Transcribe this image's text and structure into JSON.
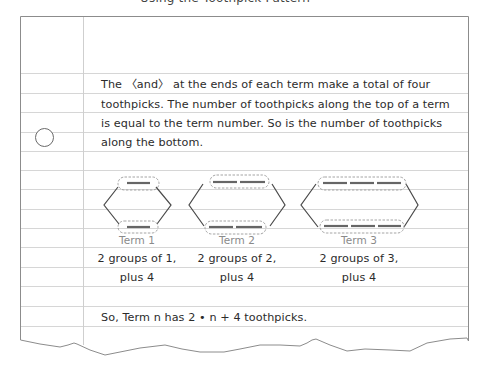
{
  "page": {
    "cutoff_heading": "Using the Toothpick Pattern",
    "paragraph_lines": [
      "The 〈and〉 at the ends of each term make a total of four",
      "toothpicks. The number of toothpicks along the top of a term",
      "is equal to the term number. So is the number of toothpicks",
      "along the bottom."
    ],
    "terms": [
      {
        "label": "Term 1",
        "caption_line1": "2 groups of 1,",
        "caption_line2": "plus 4",
        "toothpicks_per_side": 1
      },
      {
        "label": "Term 2",
        "caption_line1": "2 groups of 2,",
        "caption_line2": "plus 4",
        "toothpicks_per_side": 2
      },
      {
        "label": "Term 3",
        "caption_line1": "2 groups of 3,",
        "caption_line2": "plus 4",
        "toothpicks_per_side": 3
      }
    ],
    "conclusion": "So, Term n has 2 • n + 4 toothpicks."
  },
  "colors": {
    "rule_line": "#d4d4d4",
    "margin_line": "#c8c8c8",
    "border": "#8c8c8c",
    "toothpick": "#555555",
    "dashed_group": "#9a9a9a",
    "term_label": "#8a8a8a",
    "text": "#2b2b2b"
  }
}
